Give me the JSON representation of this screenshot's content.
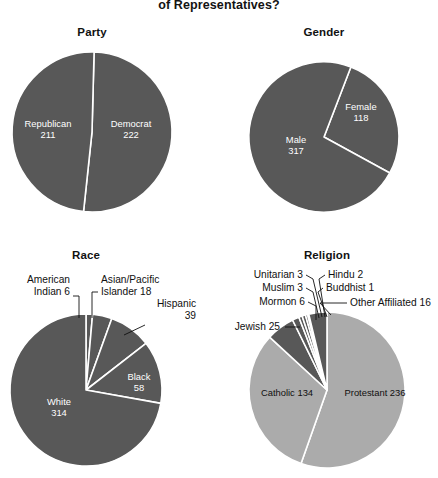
{
  "figure": {
    "title": "of Representatives?",
    "width": 438,
    "height": 478,
    "background": "#ffffff"
  },
  "colors": {
    "dark_slice": "#585858",
    "light_slice": "#ababab",
    "slice_border": "#ffffff",
    "label_light": "#ffffff",
    "label_dark": "#101010",
    "leader_line": "#101010"
  },
  "chart_data": [
    {
      "type": "pie",
      "title": "Party",
      "id": "party",
      "total": 433,
      "center": [
        92,
        132
      ],
      "radius": 80,
      "start_angle": 1.5,
      "direction": "clockwise",
      "categories": [
        "Democrat",
        "Republican"
      ],
      "values": [
        222,
        211
      ],
      "slices": [
        {
          "label": "Democrat",
          "value": 222,
          "color_role": "dark_slice",
          "label_placement": "inside",
          "label_text_line1": "Democrat",
          "label_text_line2": "222",
          "label_x": 131,
          "label_y": 130
        },
        {
          "label": "Republican",
          "value": 211,
          "color_role": "dark_slice",
          "label_placement": "inside",
          "label_text_line1": "Republican",
          "label_text_line2": "211",
          "label_x": 48,
          "label_y": 130
        }
      ]
    },
    {
      "type": "pie",
      "title": "Gender",
      "id": "gender",
      "total": 435,
      "center": [
        324,
        137
      ],
      "radius": 75,
      "start_angle": 21,
      "direction": "clockwise",
      "categories": [
        "Female",
        "Male"
      ],
      "values": [
        118,
        317
      ],
      "slices": [
        {
          "label": "Female",
          "value": 118,
          "color_role": "dark_slice",
          "label_placement": "inside",
          "label_text_line1": "Female",
          "label_text_line2": "118",
          "label_x": 361,
          "label_y": 113
        },
        {
          "label": "Male",
          "value": 317,
          "color_role": "dark_slice",
          "label_placement": "inside",
          "label_text_line1": "Male",
          "label_text_line2": "317",
          "label_x": 296,
          "label_y": 146
        }
      ]
    },
    {
      "type": "pie",
      "title": "Race",
      "id": "race",
      "total": 435,
      "center": [
        86,
        390
      ],
      "radius": 76,
      "start_angle": 0,
      "direction": "clockwise",
      "categories": [
        "American Indian",
        "Asian/Pacific Islander",
        "Hispanic",
        "Black",
        "White"
      ],
      "values": [
        6,
        18,
        39,
        58,
        314
      ],
      "slices": [
        {
          "label": "American Indian",
          "value": 6,
          "color_role": "dark_slice",
          "label_placement": "callout",
          "label_text_line1": "American",
          "label_text_line2": "Indian 6",
          "label_x": 70,
          "label_y": 286,
          "label_anchor": "anchor-end",
          "leader": "M 73,296 L 79,296 L 79,318"
        },
        {
          "label": "Asian/Pacific Islander",
          "value": 18,
          "color_role": "dark_slice",
          "label_placement": "callout",
          "label_text_line1": "Asian/Pacific",
          "label_text_line2": "Islander 18",
          "label_x": 101,
          "label_y": 286,
          "label_anchor": "anchor-start",
          "leader": "M 98,292 L 92,292 L 92,318"
        },
        {
          "label": "Hispanic",
          "value": 39,
          "color_role": "dark_slice",
          "label_placement": "callout",
          "label_text_line1": "Hispanic",
          "label_text_line2": "39",
          "label_x": 196,
          "label_y": 310,
          "label_anchor": "anchor-end",
          "leader": "M 145,325 L 124,335"
        },
        {
          "label": "Black",
          "value": 58,
          "color_role": "dark_slice",
          "label_placement": "inside",
          "label_text_line1": "Black",
          "label_text_line2": "58",
          "label_x": 139,
          "label_y": 383
        },
        {
          "label": "White",
          "value": 314,
          "color_role": "dark_slice",
          "label_placement": "inside",
          "label_text_line1": "White",
          "label_text_line2": "314",
          "label_x": 59,
          "label_y": 408
        }
      ]
    },
    {
      "type": "pie",
      "title": "Religion",
      "id": "religion",
      "total": 426,
      "center": [
        327,
        390
      ],
      "radius": 78,
      "start_angle": 0,
      "direction": "clockwise",
      "categories": [
        "Protestant",
        "Catholic",
        "Jewish",
        "Mormon",
        "Muslim",
        "Unitarian",
        "Hindu",
        "Buddhist",
        "Other Affiliated"
      ],
      "values": [
        236,
        134,
        25,
        6,
        3,
        3,
        2,
        1,
        16
      ],
      "slices": [
        {
          "label": "Protestant",
          "value": 236,
          "color_role": "light_slice",
          "label_placement": "inside-dark",
          "label_text_line1": "Protestant 236",
          "label_text_line2": "",
          "label_x": 375,
          "label_y": 394
        },
        {
          "label": "Catholic",
          "value": 134,
          "color_role": "light_slice",
          "label_placement": "inside-dark",
          "label_text_line1": "Catholic 134",
          "label_text_line2": "",
          "label_x": 287,
          "label_y": 394
        },
        {
          "label": "Jewish",
          "value": 25,
          "color_role": "dark_slice",
          "label_placement": "callout",
          "label_text_line1": "Jewish 25",
          "label_text_line2": "",
          "label_x": 280,
          "label_y": 327,
          "label_anchor": "anchor-end",
          "leader": "M 285,327 L 300,327"
        },
        {
          "label": "Mormon",
          "value": 6,
          "color_role": "dark_slice",
          "label_placement": "callout",
          "label_text_line1": "Mormon 6",
          "label_text_line2": "",
          "label_x": 305,
          "label_y": 302,
          "label_anchor": "anchor-end",
          "leader": "M 308,302 L 316,306 L 316,320"
        },
        {
          "label": "Muslim",
          "value": 3,
          "color_role": "dark_slice",
          "label_placement": "callout",
          "label_text_line1": "Muslim 3",
          "label_text_line2": "",
          "label_x": 303,
          "label_y": 288,
          "label_anchor": "anchor-end",
          "leader": "M 306,288 L 313,292 L 319,318"
        },
        {
          "label": "Unitarian",
          "value": 3,
          "color_role": "dark_slice",
          "label_placement": "callout",
          "label_text_line1": "Unitarian 3",
          "label_text_line2": "",
          "label_x": 303,
          "label_y": 275,
          "label_anchor": "anchor-end",
          "leader": "M 306,275 L 313,279 L 322,317"
        },
        {
          "label": "Hindu",
          "value": 2,
          "color_role": "dark_slice",
          "label_placement": "callout",
          "label_text_line1": "Hindu 2",
          "label_text_line2": "",
          "label_x": 328,
          "label_y": 275,
          "label_anchor": "anchor-start",
          "leader": "M 325,275 L 319,279 L 325,317"
        },
        {
          "label": "Buddhist",
          "value": 1,
          "color_role": "dark_slice",
          "label_placement": "callout",
          "label_text_line1": "Buddhist 1",
          "label_text_line2": "",
          "label_x": 326,
          "label_y": 288,
          "label_anchor": "anchor-start",
          "leader": "M 323,288 L 318,292 L 327,317"
        },
        {
          "label": "Other Affiliated",
          "value": 16,
          "color_role": "dark_slice",
          "label_placement": "callout",
          "label_text_line1": "Other Affiliated 16",
          "label_text_line2": "",
          "label_x": 350,
          "label_y": 303,
          "label_anchor": "anchor-start",
          "leader": "M 347,303 L 320,303 L 331,315"
        }
      ]
    }
  ]
}
